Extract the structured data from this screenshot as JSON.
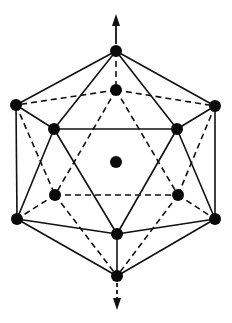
{
  "diagram": {
    "title": "Icosahedron with 5-fold axis and center atom",
    "colors": {
      "line": "#111111",
      "vertex": "#0a0a0a",
      "background": "#ffffff"
    },
    "vertex_radius": 6,
    "vertices": {
      "top": {
        "x": 116,
        "y": 51
      },
      "back_top": {
        "x": 116,
        "y": 90
      },
      "left_up": {
        "x": 16,
        "y": 105
      },
      "right_up": {
        "x": 215,
        "y": 106
      },
      "front_left": {
        "x": 54,
        "y": 129
      },
      "front_right": {
        "x": 177,
        "y": 129
      },
      "center": {
        "x": 116,
        "y": 162
      },
      "back_left": {
        "x": 55,
        "y": 195
      },
      "back_right": {
        "x": 178,
        "y": 195
      },
      "left_low": {
        "x": 17,
        "y": 219
      },
      "right_low": {
        "x": 215,
        "y": 219
      },
      "front_bottom": {
        "x": 117,
        "y": 234
      },
      "bottom": {
        "x": 117,
        "y": 276
      }
    },
    "solid_edges": [
      [
        "top",
        "left_up"
      ],
      [
        "top",
        "front_left"
      ],
      [
        "top",
        "front_right"
      ],
      [
        "top",
        "right_up"
      ],
      [
        "left_up",
        "front_left"
      ],
      [
        "front_right",
        "right_up"
      ],
      [
        "front_left",
        "front_right"
      ],
      [
        "left_up",
        "left_low"
      ],
      [
        "right_up",
        "right_low"
      ],
      [
        "front_left",
        "left_low"
      ],
      [
        "front_left",
        "front_bottom"
      ],
      [
        "front_right",
        "front_bottom"
      ],
      [
        "front_right",
        "right_low"
      ],
      [
        "left_low",
        "front_bottom"
      ],
      [
        "right_low",
        "front_bottom"
      ],
      [
        "left_low",
        "bottom"
      ],
      [
        "right_low",
        "bottom"
      ],
      [
        "front_bottom",
        "bottom"
      ]
    ],
    "dashed_edges": [
      [
        "top",
        "back_top"
      ],
      [
        "back_top",
        "left_up"
      ],
      [
        "back_top",
        "right_up"
      ],
      [
        "back_top",
        "back_left"
      ],
      [
        "back_top",
        "back_right"
      ],
      [
        "left_up",
        "back_left"
      ],
      [
        "right_up",
        "back_right"
      ],
      [
        "back_left",
        "back_right"
      ],
      [
        "back_left",
        "left_low"
      ],
      [
        "back_right",
        "right_low"
      ],
      [
        "back_left",
        "bottom"
      ],
      [
        "back_right",
        "bottom"
      ]
    ],
    "arrows": [
      {
        "name": "top-axis-arrow",
        "from": {
          "x": 116,
          "y": 44
        },
        "to": {
          "x": 116,
          "y": 14
        },
        "shaft_dashed": false
      },
      {
        "name": "bottom-axis-arrow",
        "from": {
          "x": 117,
          "y": 283
        },
        "to": {
          "x": 117,
          "y": 310
        },
        "shaft_dashed": true
      }
    ]
  }
}
